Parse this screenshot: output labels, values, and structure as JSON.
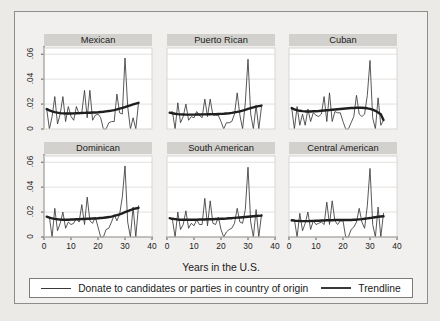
{
  "figure": {
    "background_color": "#eceae7",
    "frame_background_color": "#f2f0ee",
    "frame_border_color": "#8d8d8d",
    "panel_title_bar_color": "#d3d1ce",
    "series_color": "#3a3a3a",
    "trendline_color": "#1f1f1f",
    "gridline_color": "#e2e0dd"
  },
  "axes": {
    "x_title": "Years in the U.S.",
    "x_ticks": [
      "0",
      "10",
      "20",
      "30",
      "40"
    ],
    "x_tick_values": [
      0,
      10,
      20,
      30,
      40
    ],
    "y_ticks": [
      "0",
      ".02",
      ".04",
      ".06"
    ],
    "y_tick_values": [
      0,
      0.02,
      0.04,
      0.06
    ]
  },
  "legend": {
    "entries": [
      {
        "label": "Donate to candidates or parties in country of origin",
        "style": "thin"
      },
      {
        "label": "Trendline",
        "style": "thick"
      }
    ]
  },
  "chart_data": {
    "type": "line",
    "title": "",
    "subtitle": "",
    "xlabel": "Years in the U.S.",
    "ylabel": "",
    "xlim": [
      0,
      40
    ],
    "ylim": [
      0,
      0.065
    ],
    "grid": true,
    "legend_position": "bottom",
    "layout": {
      "rows": 2,
      "cols": 3
    },
    "panels": [
      {
        "title": "Mexican",
        "row": 0,
        "col": 0,
        "x": [
          1,
          2,
          3,
          4,
          5,
          6,
          7,
          8,
          9,
          10,
          11,
          12,
          13,
          14,
          15,
          16,
          17,
          18,
          19,
          20,
          21,
          22,
          23,
          24,
          25,
          26,
          27,
          28,
          29,
          30,
          31,
          32,
          33,
          34,
          35
        ],
        "series": [
          {
            "name": "Donate to candidates or parties in country of origin",
            "style": "thin",
            "values": [
              0.016,
              0.0,
              0.01,
              0.026,
              0.004,
              0.012,
              0.026,
              0.006,
              0.018,
              0.01,
              0.007,
              0.018,
              0.012,
              0.013,
              0.031,
              0.009,
              0.031,
              0.007,
              0.011,
              0.012,
              0.009,
              0.0,
              0.0,
              0.005,
              0.006,
              0.006,
              0.028,
              0.013,
              0.012,
              0.057,
              0.018,
              0.0,
              0.009,
              0.0,
              0.021
            ]
          },
          {
            "name": "Trendline",
            "style": "thick",
            "values": [
              0.016,
              0.015,
              0.0142,
              0.0136,
              0.0131,
              0.0127,
              0.0125,
              0.0124,
              0.0124,
              0.0124,
              0.0125,
              0.0126,
              0.0127,
              0.0128,
              0.0129,
              0.013,
              0.0131,
              0.0132,
              0.0133,
              0.0134,
              0.0136,
              0.0138,
              0.0141,
              0.0144,
              0.0148,
              0.0152,
              0.0157,
              0.0163,
              0.0169,
              0.0176,
              0.0183,
              0.019,
              0.0197,
              0.0204,
              0.021
            ]
          }
        ]
      },
      {
        "title": "Puerto Rican",
        "row": 0,
        "col": 1,
        "x": [
          1,
          2,
          3,
          4,
          5,
          6,
          7,
          8,
          9,
          10,
          11,
          12,
          13,
          14,
          15,
          16,
          17,
          18,
          19,
          20,
          21,
          22,
          23,
          24,
          25,
          26,
          27,
          28,
          29,
          30,
          31,
          32,
          33,
          34,
          35
        ],
        "series": [
          {
            "name": "Donate to candidates or parties in country of origin",
            "style": "thin",
            "values": [
              0.013,
              0.014,
              0.0,
              0.021,
              0.005,
              0.01,
              0.02,
              0.007,
              0.01,
              0.009,
              0.014,
              0.011,
              0.009,
              0.024,
              0.01,
              0.024,
              0.011,
              0.011,
              0.011,
              0.006,
              0.0,
              0.005,
              0.005,
              0.006,
              0.012,
              0.029,
              0.011,
              0.0,
              0.021,
              0.056,
              0.012,
              0.0,
              0.019,
              0.0,
              0.018
            ]
          },
          {
            "name": "Trendline",
            "style": "thick",
            "values": [
              0.0131,
              0.0126,
              0.0122,
              0.0119,
              0.0117,
              0.0116,
              0.0115,
              0.0115,
              0.0115,
              0.0115,
              0.0116,
              0.0116,
              0.0117,
              0.0117,
              0.0118,
              0.0118,
              0.0119,
              0.0119,
              0.012,
              0.0121,
              0.0122,
              0.0124,
              0.0126,
              0.0129,
              0.0133,
              0.0137,
              0.0142,
              0.0148,
              0.0154,
              0.0161,
              0.0167,
              0.0173,
              0.0179,
              0.0184,
              0.0188
            ]
          }
        ]
      },
      {
        "title": "Cuban",
        "row": 0,
        "col": 2,
        "x": [
          1,
          2,
          3,
          4,
          5,
          6,
          7,
          8,
          9,
          10,
          11,
          12,
          13,
          14,
          15,
          16,
          17,
          18,
          19,
          20,
          21,
          22,
          23,
          24,
          25,
          26,
          27,
          28,
          29,
          30,
          31,
          32,
          33,
          34,
          35
        ],
        "series": [
          {
            "name": "Donate to candidates or parties in country of origin",
            "style": "thin",
            "values": [
              0.017,
              0.0,
              0.018,
              0.003,
              0.012,
              0.003,
              0.016,
              0.006,
              0.013,
              0.011,
              0.01,
              0.012,
              0.026,
              0.006,
              0.029,
              0.006,
              0.014,
              0.013,
              0.013,
              0.006,
              0.0,
              0.0,
              0.005,
              0.01,
              0.027,
              0.012,
              0.01,
              0.012,
              0.027,
              0.055,
              0.009,
              0.0,
              0.025,
              0.003,
              0.007
            ]
          },
          {
            "name": "Trendline",
            "style": "thick",
            "values": [
              0.0168,
              0.0158,
              0.0151,
              0.0146,
              0.0143,
              0.0141,
              0.0141,
              0.0141,
              0.0142,
              0.0143,
              0.0144,
              0.0146,
              0.0148,
              0.015,
              0.0152,
              0.0155,
              0.0157,
              0.0159,
              0.0161,
              0.0163,
              0.0165,
              0.0167,
              0.0168,
              0.0169,
              0.017,
              0.017,
              0.017,
              0.0169,
              0.0166,
              0.0162,
              0.0155,
              0.0146,
              0.0133,
              0.0118,
              0.0072
            ]
          }
        ]
      },
      {
        "title": "Dominican",
        "row": 1,
        "col": 0,
        "x": [
          1,
          2,
          3,
          4,
          5,
          6,
          7,
          8,
          9,
          10,
          11,
          12,
          13,
          14,
          15,
          16,
          17,
          18,
          19,
          20,
          21,
          22,
          23,
          24,
          25,
          26,
          27,
          28,
          29,
          30,
          31,
          32,
          33,
          34,
          35
        ],
        "series": [
          {
            "name": "Donate to candidates or parties in country of origin",
            "style": "thin",
            "values": [
              0.016,
              0.016,
              0.0,
              0.023,
              0.005,
              0.011,
              0.02,
              0.007,
              0.012,
              0.01,
              0.011,
              0.015,
              0.012,
              0.026,
              0.01,
              0.032,
              0.013,
              0.011,
              0.016,
              0.008,
              0.0,
              0.0,
              0.006,
              0.007,
              0.012,
              0.018,
              0.013,
              0.018,
              0.032,
              0.057,
              0.012,
              0.0,
              0.024,
              0.0,
              0.025
            ]
          },
          {
            "name": "Trendline",
            "style": "thick",
            "values": [
              0.0163,
              0.0155,
              0.0149,
              0.0145,
              0.0142,
              0.014,
              0.0139,
              0.0139,
              0.0139,
              0.014,
              0.0141,
              0.0142,
              0.0143,
              0.0144,
              0.0145,
              0.0146,
              0.0147,
              0.0148,
              0.0149,
              0.015,
              0.0152,
              0.0154,
              0.0157,
              0.016,
              0.0164,
              0.0169,
              0.0175,
              0.0182,
              0.019,
              0.0199,
              0.0208,
              0.0216,
              0.0223,
              0.0229,
              0.0234
            ]
          }
        ]
      },
      {
        "title": "South American",
        "row": 1,
        "col": 1,
        "x": [
          1,
          2,
          3,
          4,
          5,
          6,
          7,
          8,
          9,
          10,
          11,
          12,
          13,
          14,
          15,
          16,
          17,
          18,
          19,
          20,
          21,
          22,
          23,
          24,
          25,
          26,
          27,
          28,
          29,
          30,
          31,
          32,
          33,
          34,
          35
        ],
        "series": [
          {
            "name": "Donate to candidates or parties in country of origin",
            "style": "thin",
            "values": [
              0.015,
              0.014,
              0.0,
              0.02,
              0.006,
              0.01,
              0.021,
              0.007,
              0.011,
              0.009,
              0.014,
              0.01,
              0.01,
              0.031,
              0.009,
              0.029,
              0.011,
              0.01,
              0.016,
              0.006,
              0.0,
              0.004,
              0.006,
              0.007,
              0.011,
              0.023,
              0.012,
              0.011,
              0.022,
              0.056,
              0.012,
              0.0,
              0.022,
              0.0,
              0.018
            ]
          },
          {
            "name": "Trendline",
            "style": "thick",
            "values": [
              0.0151,
              0.0146,
              0.0143,
              0.014,
              0.0139,
              0.0138,
              0.0138,
              0.0138,
              0.0138,
              0.0139,
              0.0139,
              0.014,
              0.014,
              0.0141,
              0.0142,
              0.0142,
              0.0143,
              0.0144,
              0.0145,
              0.0146,
              0.0147,
              0.0148,
              0.015,
              0.0151,
              0.0153,
              0.0155,
              0.0157,
              0.0159,
              0.0161,
              0.0163,
              0.0165,
              0.0167,
              0.0169,
              0.017,
              0.0172
            ]
          }
        ]
      },
      {
        "title": "Central American",
        "row": 1,
        "col": 2,
        "x": [
          1,
          2,
          3,
          4,
          5,
          6,
          7,
          8,
          9,
          10,
          11,
          12,
          13,
          14,
          15,
          16,
          17,
          18,
          19,
          20,
          21,
          22,
          23,
          24,
          25,
          26,
          27,
          28,
          29,
          30,
          31,
          32,
          33,
          34,
          35
        ],
        "series": [
          {
            "name": "Donate to candidates or parties in country of origin",
            "style": "thin",
            "values": [
              0.013,
              0.014,
              0.0,
              0.019,
              0.005,
              0.011,
              0.02,
              0.006,
              0.013,
              0.01,
              0.011,
              0.012,
              0.01,
              0.028,
              0.01,
              0.029,
              0.013,
              0.01,
              0.013,
              0.013,
              0.0,
              0.0,
              0.006,
              0.008,
              0.012,
              0.023,
              0.012,
              0.007,
              0.025,
              0.055,
              0.01,
              0.0,
              0.024,
              0.0,
              0.019
            ]
          },
          {
            "name": "Trendline",
            "style": "thick",
            "values": [
              0.0134,
              0.0131,
              0.0129,
              0.0128,
              0.0127,
              0.0127,
              0.0127,
              0.0128,
              0.0129,
              0.013,
              0.0131,
              0.0132,
              0.0133,
              0.0134,
              0.0135,
              0.0135,
              0.0136,
              0.0136,
              0.0136,
              0.0136,
              0.0136,
              0.0136,
              0.0137,
              0.0138,
              0.0139,
              0.0141,
              0.0143,
              0.0146,
              0.0149,
              0.0152,
              0.0156,
              0.0159,
              0.0162,
              0.0164,
              0.0166
            ]
          }
        ]
      }
    ]
  }
}
